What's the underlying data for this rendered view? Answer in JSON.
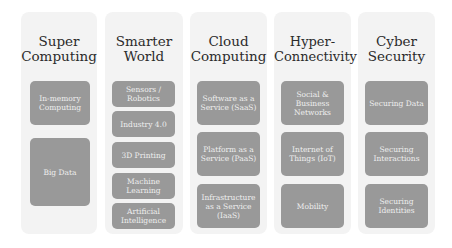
{
  "colors": {
    "column_bg": "#f3f3f3",
    "box_fill": "#999999",
    "box_text": "#eeeeee",
    "title_text": "#2b2b2b"
  },
  "columns": [
    {
      "title": "Super Computing",
      "items": [
        "In-memory Computing",
        "Big Data"
      ]
    },
    {
      "title": "Smarter World",
      "items": [
        "Sensors / Robotics",
        "Industry 4.0",
        "3D Printing",
        "Machine Learning",
        "Artificial Intelligence"
      ]
    },
    {
      "title": "Cloud Computing",
      "items": [
        "Software as a Service (SaaS)",
        "Platform as a Service (PaaS)",
        "Infrastructure as a Service (IaaS)"
      ]
    },
    {
      "title": "Hyper-Connectivity",
      "items": [
        "Social & Business Networks",
        "Internet of Things (IoT)",
        "Mobility"
      ]
    },
    {
      "title": "Cyber Security",
      "items": [
        "Securing Data",
        "Securing Interactions",
        "Securing Identities"
      ]
    }
  ]
}
